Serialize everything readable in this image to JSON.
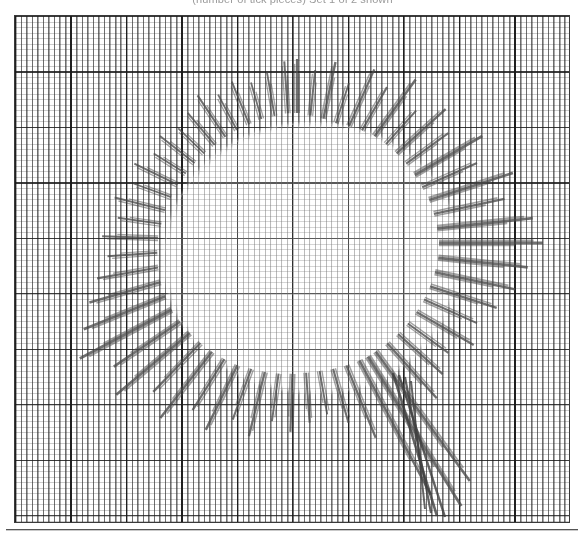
{
  "page": {
    "width": 585,
    "height": 534,
    "background": "#ffffff"
  },
  "caption": {
    "text": "(number of tick pieces) Set 1 of 2 shown",
    "visible_fragment": "cut off at top edge of image",
    "color": "#9a9a9a"
  },
  "plot": {
    "frame": {
      "x": 14,
      "y": 15,
      "width": 556,
      "height": 508,
      "border_color": "#3a3a3a"
    },
    "paper": {
      "fine_cell_px": 5.55,
      "major_cell_px": 55.5,
      "fine_line_color": "#5a5a5a",
      "major_line_color": "#191919",
      "fill_color": "#ffffff"
    },
    "texture": {
      "name": "tally-tick-field",
      "description": "dense short vertical tick marks filling the outer field",
      "color": "#464646"
    },
    "hole": {
      "name": "central-blank-region",
      "cx": 296,
      "cy": 242,
      "rx": 146,
      "ry": 134,
      "fill": "#ffffff"
    },
    "rule": {
      "y": 529,
      "color": "#555555"
    }
  },
  "chart_data": {
    "type": "scatter",
    "title": "",
    "subtitle": "",
    "xlabel": "",
    "ylabel": "",
    "grid": true,
    "legend": "none",
    "xlim": [
      0,
      100
    ],
    "ylim": [
      0,
      100
    ],
    "xticks": [
      0,
      10,
      20,
      30,
      40,
      50,
      60,
      70,
      80,
      90,
      100
    ],
    "yticks": [
      0,
      100,
      200,
      300,
      400,
      500,
      600,
      700,
      800,
      900,
      1000
    ],
    "series": [
      {
        "name": "radial-streaks",
        "color": "#4a4a4a",
        "segments": [
          {
            "a": -90,
            "r0": 130,
            "len": 54,
            "w": 2.2
          },
          {
            "a": -84,
            "r0": 128,
            "len": 46,
            "w": 2.0
          },
          {
            "a": -78,
            "r0": 127,
            "len": 58,
            "w": 2.4
          },
          {
            "a": -72,
            "r0": 126,
            "len": 42,
            "w": 1.9
          },
          {
            "a": -66,
            "r0": 128,
            "len": 62,
            "w": 2.3
          },
          {
            "a": -60,
            "r0": 130,
            "len": 50,
            "w": 2.1
          },
          {
            "a": -54,
            "r0": 132,
            "len": 70,
            "w": 2.5
          },
          {
            "a": -48,
            "r0": 133,
            "len": 45,
            "w": 2.0
          },
          {
            "a": -42,
            "r0": 134,
            "len": 66,
            "w": 2.4
          },
          {
            "a": -36,
            "r0": 135,
            "len": 52,
            "w": 2.1
          },
          {
            "a": -30,
            "r0": 136,
            "len": 78,
            "w": 2.6
          },
          {
            "a": -24,
            "r0": 137,
            "len": 60,
            "w": 2.2
          },
          {
            "a": -18,
            "r0": 139,
            "len": 88,
            "w": 2.7
          },
          {
            "a": -12,
            "r0": 140,
            "len": 72,
            "w": 2.4
          },
          {
            "a": -6,
            "r0": 141,
            "len": 96,
            "w": 2.8
          },
          {
            "a": 0,
            "r0": 142,
            "len": 104,
            "w": 2.9
          },
          {
            "a": 6,
            "r0": 142,
            "len": 90,
            "w": 2.7
          },
          {
            "a": 12,
            "r0": 141,
            "len": 82,
            "w": 2.5
          },
          {
            "a": 18,
            "r0": 140,
            "len": 70,
            "w": 2.3
          },
          {
            "a": 24,
            "r0": 139,
            "len": 58,
            "w": 2.1
          },
          {
            "a": 30,
            "r0": 138,
            "len": 66,
            "w": 2.3
          },
          {
            "a": 36,
            "r0": 137,
            "len": 50,
            "w": 2.0
          },
          {
            "a": 42,
            "r0": 136,
            "len": 60,
            "w": 2.2
          },
          {
            "a": 48,
            "r0": 135,
            "len": 74,
            "w": 2.4
          },
          {
            "a": 54,
            "r0": 134,
            "len": 160,
            "w": 2.6
          },
          {
            "a": 58,
            "r0": 134,
            "len": 176,
            "w": 2.8
          },
          {
            "a": 62,
            "r0": 133,
            "len": 152,
            "w": 2.5
          },
          {
            "a": 68,
            "r0": 132,
            "len": 78,
            "w": 2.3
          },
          {
            "a": 74,
            "r0": 131,
            "len": 56,
            "w": 2.1
          },
          {
            "a": 80,
            "r0": 130,
            "len": 44,
            "w": 1.9
          },
          {
            "a": 86,
            "r0": 130,
            "len": 50,
            "w": 2.0
          },
          {
            "a": 92,
            "r0": 131,
            "len": 58,
            "w": 2.2
          },
          {
            "a": 98,
            "r0": 132,
            "len": 48,
            "w": 2.0
          },
          {
            "a": 104,
            "r0": 133,
            "len": 66,
            "w": 2.3
          },
          {
            "a": 110,
            "r0": 134,
            "len": 54,
            "w": 2.1
          },
          {
            "a": 116,
            "r0": 136,
            "len": 72,
            "w": 2.4
          },
          {
            "a": 122,
            "r0": 137,
            "len": 60,
            "w": 2.2
          },
          {
            "a": 128,
            "r0": 138,
            "len": 84,
            "w": 2.5
          },
          {
            "a": 134,
            "r0": 139,
            "len": 68,
            "w": 2.3
          },
          {
            "a": 140,
            "r0": 140,
            "len": 96,
            "w": 2.7
          },
          {
            "a": 146,
            "r0": 141,
            "len": 80,
            "w": 2.5
          },
          {
            "a": 152,
            "r0": 142,
            "len": 104,
            "w": 2.8
          },
          {
            "a": 158,
            "r0": 142,
            "len": 88,
            "w": 2.6
          },
          {
            "a": 164,
            "r0": 142,
            "len": 74,
            "w": 2.4
          },
          {
            "a": 170,
            "r0": 141,
            "len": 62,
            "w": 2.2
          },
          {
            "a": 176,
            "r0": 140,
            "len": 50,
            "w": 2.0
          },
          {
            "a": 182,
            "r0": 139,
            "len": 56,
            "w": 2.1
          },
          {
            "a": 188,
            "r0": 137,
            "len": 44,
            "w": 1.9
          },
          {
            "a": 194,
            "r0": 136,
            "len": 52,
            "w": 2.0
          },
          {
            "a": 200,
            "r0": 134,
            "len": 40,
            "w": 1.8
          },
          {
            "a": 206,
            "r0": 133,
            "len": 48,
            "w": 2.0
          },
          {
            "a": 212,
            "r0": 131,
            "len": 38,
            "w": 1.8
          },
          {
            "a": 218,
            "r0": 130,
            "len": 44,
            "w": 1.9
          },
          {
            "a": 224,
            "r0": 129,
            "len": 36,
            "w": 1.7
          },
          {
            "a": 230,
            "r0": 128,
            "len": 42,
            "w": 1.9
          },
          {
            "a": 236,
            "r0": 128,
            "len": 50,
            "w": 2.0
          },
          {
            "a": 242,
            "r0": 128,
            "len": 40,
            "w": 1.8
          },
          {
            "a": 248,
            "r0": 128,
            "len": 46,
            "w": 1.9
          },
          {
            "a": 254,
            "r0": 129,
            "len": 38,
            "w": 1.8
          },
          {
            "a": 260,
            "r0": 129,
            "len": 44,
            "w": 1.9
          },
          {
            "a": 266,
            "r0": 130,
            "len": 52,
            "w": 2.0
          }
        ]
      },
      {
        "name": "long-lower-right-streaks",
        "color": "#3f3f3f",
        "lines": [
          {
            "x1": 392,
            "y1": 372,
            "x2": 436,
            "y2": 515,
            "w": 2.6
          },
          {
            "x1": 398,
            "y1": 374,
            "x2": 444,
            "y2": 516,
            "w": 2.4
          },
          {
            "x1": 404,
            "y1": 376,
            "x2": 430,
            "y2": 512,
            "w": 2.2
          },
          {
            "x1": 410,
            "y1": 380,
            "x2": 424,
            "y2": 508,
            "w": 2.0
          }
        ]
      }
    ]
  }
}
